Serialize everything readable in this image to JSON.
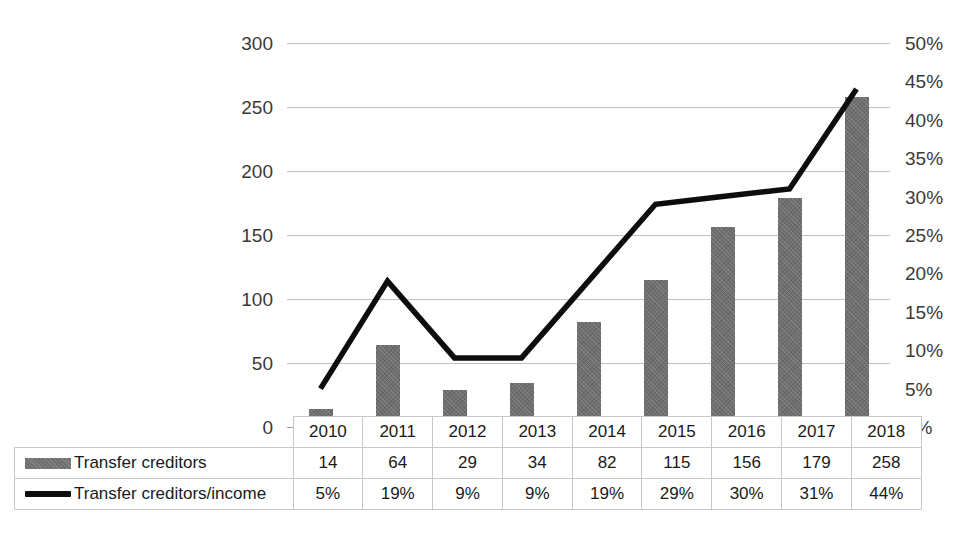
{
  "chart_data": {
    "type": "bar",
    "title": "",
    "subtitle": "",
    "xlabel": "",
    "ylabel": "",
    "categories": [
      "2010",
      "2011",
      "2012",
      "2013",
      "2014",
      "2015",
      "2016",
      "2017",
      "2018"
    ],
    "series": [
      {
        "name": "Transfer creditors",
        "type": "bar",
        "axis": "left",
        "color": "#6f6f6f",
        "values": [
          14,
          64,
          29,
          34,
          82,
          115,
          156,
          179,
          258
        ],
        "value_labels": [
          "14",
          "64",
          "29",
          "34",
          "82",
          "115",
          "156",
          "179",
          "258"
        ]
      },
      {
        "name": "Transfer creditors/income",
        "type": "line",
        "axis": "right",
        "color": "#0d0d0d",
        "values": [
          5,
          19,
          9,
          9,
          19,
          29,
          30,
          31,
          44
        ],
        "value_labels": [
          "5%",
          "19%",
          "9%",
          "9%",
          "19%",
          "29%",
          "30%",
          "31%",
          "44%"
        ]
      }
    ],
    "left_axis": {
      "min": 0,
      "max": 300,
      "step": 50,
      "ticks": [
        "300",
        "250",
        "200",
        "150",
        "100",
        "50",
        "0"
      ]
    },
    "right_axis": {
      "min": 0,
      "max": 50,
      "step": 5,
      "unit": "%",
      "ticks": [
        "50%",
        "45%",
        "40%",
        "35%",
        "30%",
        "25%",
        "20%",
        "15%",
        "10%",
        "5%",
        "0%"
      ]
    },
    "grid": true,
    "legend_position": "data-table"
  },
  "table": {
    "year_row": [
      "2010",
      "2011",
      "2012",
      "2013",
      "2014",
      "2015",
      "2016",
      "2017",
      "2018"
    ],
    "rows": [
      {
        "label": "Transfer creditors",
        "swatch": "bar-swatch",
        "values": [
          "14",
          "64",
          "29",
          "34",
          "82",
          "115",
          "156",
          "179",
          "258"
        ]
      },
      {
        "label": "Transfer creditors/income",
        "swatch": "line-swatch",
        "values": [
          "5%",
          "19%",
          "9%",
          "9%",
          "19%",
          "29%",
          "30%",
          "31%",
          "44%"
        ]
      }
    ]
  }
}
